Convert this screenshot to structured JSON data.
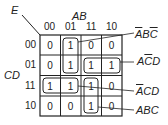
{
  "kmap": {
    "corner_label": "E",
    "col_var": "AB",
    "row_var": "CD",
    "col_labels": [
      "00",
      "01",
      "11",
      "10"
    ],
    "row_labels": [
      "00",
      "01",
      "11",
      "10"
    ],
    "cells": [
      [
        "0",
        "1",
        "0",
        "0"
      ],
      [
        "0",
        "1",
        "1",
        "1"
      ],
      [
        "1",
        "1",
        "1",
        "0"
      ],
      [
        "0",
        "0",
        "1",
        "0"
      ]
    ],
    "groups": [
      {
        "term": "A̅BC̅",
        "parts": [
          {
            "t": "A",
            "bar": true
          },
          {
            "t": "B",
            "bar": false
          },
          {
            "t": "C",
            "bar": true
          }
        ]
      },
      {
        "term": "AC̅D",
        "parts": [
          {
            "t": "A",
            "bar": false
          },
          {
            "t": "C",
            "bar": true
          },
          {
            "t": "D",
            "bar": false
          }
        ]
      },
      {
        "term": "A̅CD",
        "parts": [
          {
            "t": "A",
            "bar": true
          },
          {
            "t": "C",
            "bar": false
          },
          {
            "t": "D",
            "bar": false
          }
        ]
      },
      {
        "term": "ABC",
        "parts": [
          {
            "t": "A",
            "bar": false
          },
          {
            "t": "B",
            "bar": false
          },
          {
            "t": "C",
            "bar": false
          }
        ]
      }
    ]
  }
}
